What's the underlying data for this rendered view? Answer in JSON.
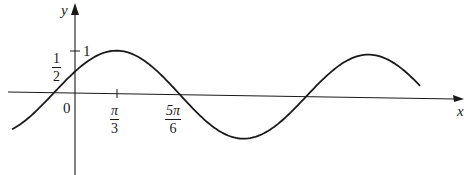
{
  "chart_data": {
    "type": "line",
    "title": "",
    "function": "y = sin(x + π/6)",
    "xlabel": "x",
    "ylabel": "y",
    "x_ticks": [
      {
        "value": 0,
        "label": "0"
      },
      {
        "value": 1.0472,
        "label_num": "π",
        "label_den": "3"
      },
      {
        "value": 2.618,
        "label_num": "5π",
        "label_den": "6"
      }
    ],
    "y_ticks": [
      {
        "value": 1,
        "label": "1"
      },
      {
        "value": 0.5,
        "label_num": "1",
        "label_den": "2"
      }
    ],
    "xlim": [
      -0.5,
      3.0
    ],
    "ylim": [
      -1.0,
      1.0
    ],
    "grid": false,
    "legend": "none",
    "key_points": [
      {
        "x": -0.5236,
        "y": 0
      },
      {
        "x": 0,
        "y": 0.5
      },
      {
        "x": 1.0472,
        "y": 1
      },
      {
        "x": 2.618,
        "y": 0
      },
      {
        "x": 4.1888,
        "y": -1
      },
      {
        "x": 5.7596,
        "y": 0
      },
      {
        "x": 7.3304,
        "y": 1
      },
      {
        "x": 8.9012,
        "y": 0
      }
    ],
    "style": {
      "line_color": "#1a1a1a",
      "axis_color": "#1a1a1a",
      "background": "#ffffff"
    }
  },
  "labels": {
    "x_axis": "x",
    "y_axis": "y",
    "origin": "0",
    "y_one": "1",
    "y_half_num": "1",
    "y_half_den": "2",
    "x_pi3_num": "π",
    "x_pi3_den": "3",
    "x_5pi6_num": "5π",
    "x_5pi6_den": "6"
  }
}
